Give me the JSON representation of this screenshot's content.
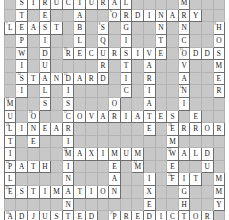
{
  "puzzle": {
    "title": "Statistics Crossword Grid",
    "columns": 19,
    "rows": 18,
    "colors": {
      "blocked": "#c8c8c8",
      "cell": "#ffffff",
      "letter": "#1a1a1a",
      "grid_line": "#6e6e6e"
    },
    "answers_across": [
      "STRUCTURAL",
      "ORDINARY",
      "LEAST",
      "RECURSIVE",
      "ODDS",
      "STANDARD",
      "COVARIATES",
      "LINEAR",
      "ERROR",
      "MAXIMUM",
      "WALD",
      "PATH",
      "FIT",
      "ESTIMATION",
      "ADJUSTED",
      "PREDICTOR"
    ],
    "rows_data": [
      [
        {
          "t": "b"
        },
        {
          "t": "c",
          "l": "S",
          "n": "1"
        },
        {
          "t": "c",
          "l": "T"
        },
        {
          "t": "c",
          "l": "R",
          "n": "2"
        },
        {
          "t": "c",
          "l": "U"
        },
        {
          "t": "c",
          "l": "C"
        },
        {
          "t": "c",
          "l": "T",
          "n": "3"
        },
        {
          "t": "c",
          "l": "U"
        },
        {
          "t": "c",
          "l": "R"
        },
        {
          "t": "c",
          "l": "A"
        },
        {
          "t": "c",
          "l": "L",
          "n": "4"
        },
        {
          "t": "b"
        },
        {
          "t": "b"
        },
        {
          "t": "b"
        },
        {
          "t": "b"
        },
        {
          "t": "c",
          "l": "M",
          "n": "5"
        },
        {
          "t": "b"
        },
        {
          "t": "b"
        },
        {
          "t": "b"
        }
      ],
      [
        {
          "t": "b"
        },
        {
          "t": "c",
          "l": "T"
        },
        {
          "t": "b"
        },
        {
          "t": "c",
          "l": "E"
        },
        {
          "t": "b"
        },
        {
          "t": "b"
        },
        {
          "t": "c",
          "l": "A"
        },
        {
          "t": "b"
        },
        {
          "t": "b"
        },
        {
          "t": "c",
          "l": "O",
          "n": "6"
        },
        {
          "t": "c",
          "l": "R"
        },
        {
          "t": "c",
          "l": "D"
        },
        {
          "t": "c",
          "l": "I"
        },
        {
          "t": "c",
          "l": "N"
        },
        {
          "t": "c",
          "l": "A"
        },
        {
          "t": "c",
          "l": "R"
        },
        {
          "t": "c",
          "l": "Y"
        },
        {
          "t": "b"
        },
        {
          "t": "b"
        }
      ],
      [
        {
          "t": "c",
          "l": "L",
          "n": "7"
        },
        {
          "t": "c",
          "l": "E"
        },
        {
          "t": "c",
          "l": "A"
        },
        {
          "t": "c",
          "l": "S"
        },
        {
          "t": "c",
          "l": "T"
        },
        {
          "t": "b"
        },
        {
          "t": "c",
          "l": "B"
        },
        {
          "t": "b"
        },
        {
          "t": "c",
          "l": "S",
          "n": "8"
        },
        {
          "t": "b"
        },
        {
          "t": "c",
          "l": "G"
        },
        {
          "t": "b"
        },
        {
          "t": "b"
        },
        {
          "t": "c",
          "l": "N"
        },
        {
          "t": "b"
        },
        {
          "t": "c",
          "l": "N"
        },
        {
          "t": "b"
        },
        {
          "t": "b"
        },
        {
          "t": "c",
          "l": "H",
          "n": "9"
        }
      ],
      [
        {
          "t": "b"
        },
        {
          "t": "c",
          "l": "P"
        },
        {
          "t": "b"
        },
        {
          "t": "c",
          "l": "I"
        },
        {
          "t": "b"
        },
        {
          "t": "b"
        },
        {
          "t": "c",
          "l": "L"
        },
        {
          "t": "b"
        },
        {
          "t": "c",
          "l": "Q"
        },
        {
          "t": "b"
        },
        {
          "t": "c",
          "l": "I"
        },
        {
          "t": "b"
        },
        {
          "t": "b"
        },
        {
          "t": "c",
          "l": "T"
        },
        {
          "t": "b"
        },
        {
          "t": "c",
          "l": "C"
        },
        {
          "t": "b"
        },
        {
          "t": "b"
        },
        {
          "t": "c",
          "l": "O"
        }
      ],
      [
        {
          "t": "b"
        },
        {
          "t": "c",
          "l": "W"
        },
        {
          "t": "b"
        },
        {
          "t": "c",
          "l": "D"
        },
        {
          "t": "b"
        },
        {
          "t": "c",
          "l": "R",
          "n": "10"
        },
        {
          "t": "c",
          "l": "E"
        },
        {
          "t": "c",
          "l": "C"
        },
        {
          "t": "c",
          "l": "U"
        },
        {
          "t": "c",
          "l": "R"
        },
        {
          "t": "c",
          "l": "S"
        },
        {
          "t": "c",
          "l": "I"
        },
        {
          "t": "c",
          "l": "V"
        },
        {
          "t": "c",
          "l": "E"
        },
        {
          "t": "b"
        },
        {
          "t": "c",
          "l": "O",
          "n": "11"
        },
        {
          "t": "c",
          "l": "D"
        },
        {
          "t": "c",
          "l": "D"
        },
        {
          "t": "c",
          "l": "S"
        }
      ],
      [
        {
          "t": "b"
        },
        {
          "t": "c",
          "l": "I"
        },
        {
          "t": "b"
        },
        {
          "t": "c",
          "l": "U"
        },
        {
          "t": "b"
        },
        {
          "t": "b"
        },
        {
          "t": "b"
        },
        {
          "t": "b"
        },
        {
          "t": "c",
          "l": "R"
        },
        {
          "t": "b"
        },
        {
          "t": "c",
          "l": "T"
        },
        {
          "t": "b"
        },
        {
          "t": "c",
          "l": "A"
        },
        {
          "t": "b"
        },
        {
          "t": "b"
        },
        {
          "t": "c",
          "l": "V"
        },
        {
          "t": "b"
        },
        {
          "t": "b"
        },
        {
          "t": "c",
          "l": "M"
        }
      ],
      [
        {
          "t": "b"
        },
        {
          "t": "c",
          "l": "S",
          "n": "12"
        },
        {
          "t": "c",
          "l": "T"
        },
        {
          "t": "c",
          "l": "A"
        },
        {
          "t": "c",
          "l": "N"
        },
        {
          "t": "c",
          "l": "D",
          "n": "13"
        },
        {
          "t": "c",
          "l": "A"
        },
        {
          "t": "c",
          "l": "R"
        },
        {
          "t": "c",
          "l": "D"
        },
        {
          "t": "b"
        },
        {
          "t": "c",
          "l": "I"
        },
        {
          "t": "b"
        },
        {
          "t": "c",
          "l": "R"
        },
        {
          "t": "b"
        },
        {
          "t": "b"
        },
        {
          "t": "c",
          "l": "A"
        },
        {
          "t": "b"
        },
        {
          "t": "b"
        },
        {
          "t": "c",
          "l": "E"
        }
      ],
      [
        {
          "t": "b"
        },
        {
          "t": "c",
          "l": "I"
        },
        {
          "t": "b"
        },
        {
          "t": "c",
          "l": "L"
        },
        {
          "t": "b"
        },
        {
          "t": "c",
          "l": "I"
        },
        {
          "t": "b"
        },
        {
          "t": "b"
        },
        {
          "t": "b"
        },
        {
          "t": "b"
        },
        {
          "t": "c",
          "l": "C"
        },
        {
          "t": "b"
        },
        {
          "t": "c",
          "l": "I"
        },
        {
          "t": "b"
        },
        {
          "t": "b"
        },
        {
          "t": "c",
          "l": "N",
          "n": "14"
        },
        {
          "t": "b"
        },
        {
          "t": "b"
        },
        {
          "t": "c",
          "l": "R"
        }
      ],
      [
        {
          "t": "c",
          "l": "M",
          "n": "15"
        },
        {
          "t": "b"
        },
        {
          "t": "b"
        },
        {
          "t": "c",
          "l": "S"
        },
        {
          "t": "b"
        },
        {
          "t": "c",
          "l": "S"
        },
        {
          "t": "b"
        },
        {
          "t": "b"
        },
        {
          "t": "b"
        },
        {
          "t": "c",
          "l": "O"
        },
        {
          "t": "b"
        },
        {
          "t": "b"
        },
        {
          "t": "c",
          "l": "A"
        },
        {
          "t": "b"
        },
        {
          "t": "b"
        },
        {
          "t": "c",
          "l": "I"
        },
        {
          "t": "b"
        },
        {
          "t": "b"
        },
        {
          "t": "b"
        }
      ],
      [
        {
          "t": "c",
          "l": "U"
        },
        {
          "t": "b"
        },
        {
          "t": "c",
          "l": "O",
          "n": "16"
        },
        {
          "t": "b"
        },
        {
          "t": "b"
        },
        {
          "t": "c",
          "l": "C",
          "n": "17"
        },
        {
          "t": "c",
          "l": "O"
        },
        {
          "t": "c",
          "l": "V"
        },
        {
          "t": "c",
          "l": "A"
        },
        {
          "t": "c",
          "l": "R"
        },
        {
          "t": "c",
          "l": "I"
        },
        {
          "t": "c",
          "l": "A"
        },
        {
          "t": "c",
          "l": "T"
        },
        {
          "t": "c",
          "l": "E"
        },
        {
          "t": "c",
          "l": "S"
        },
        {
          "t": "b"
        },
        {
          "t": "c",
          "l": "E"
        },
        {
          "t": "b"
        },
        {
          "t": "b"
        }
      ],
      [
        {
          "t": "c",
          "l": "L",
          "n": "18"
        },
        {
          "t": "c",
          "l": "I"
        },
        {
          "t": "c",
          "l": "N"
        },
        {
          "t": "c",
          "l": "E"
        },
        {
          "t": "c",
          "l": "A"
        },
        {
          "t": "c",
          "l": "R"
        },
        {
          "t": "b"
        },
        {
          "t": "b"
        },
        {
          "t": "b"
        },
        {
          "t": "b"
        },
        {
          "t": "b"
        },
        {
          "t": "b"
        },
        {
          "t": "c",
          "l": "E"
        },
        {
          "t": "b"
        },
        {
          "t": "c",
          "l": "E",
          "n": "19"
        },
        {
          "t": "c",
          "l": "R"
        },
        {
          "t": "c",
          "l": "R"
        },
        {
          "t": "c",
          "l": "O"
        },
        {
          "t": "c",
          "l": "R"
        }
      ],
      [
        {
          "t": "c",
          "l": "T"
        },
        {
          "t": "b"
        },
        {
          "t": "c",
          "l": "E"
        },
        {
          "t": "b"
        },
        {
          "t": "b"
        },
        {
          "t": "c",
          "l": "I"
        },
        {
          "t": "b"
        },
        {
          "t": "b"
        },
        {
          "t": "b"
        },
        {
          "t": "b"
        },
        {
          "t": "b"
        },
        {
          "t": "b"
        },
        {
          "t": "b"
        },
        {
          "t": "b"
        },
        {
          "t": "c",
          "l": "M"
        },
        {
          "t": "b"
        },
        {
          "t": "b"
        },
        {
          "t": "b"
        },
        {
          "t": "b"
        }
      ],
      [
        {
          "t": "c",
          "l": "I"
        },
        {
          "t": "b"
        },
        {
          "t": "b"
        },
        {
          "t": "b"
        },
        {
          "t": "b"
        },
        {
          "t": "c",
          "l": "M",
          "n": "20"
        },
        {
          "t": "c",
          "l": "A"
        },
        {
          "t": "c",
          "l": "X"
        },
        {
          "t": "c",
          "l": "I"
        },
        {
          "t": "c",
          "l": "M"
        },
        {
          "t": "c",
          "l": "U"
        },
        {
          "t": "c",
          "l": "M"
        },
        {
          "t": "b"
        },
        {
          "t": "b"
        },
        {
          "t": "c",
          "l": "W",
          "n": "21"
        },
        {
          "t": "c",
          "l": "A"
        },
        {
          "t": "c",
          "l": "L"
        },
        {
          "t": "c",
          "l": "D"
        },
        {
          "t": "b"
        }
      ],
      [
        {
          "t": "c",
          "l": "P",
          "n": "22"
        },
        {
          "t": "c",
          "l": "A"
        },
        {
          "t": "c",
          "l": "T"
        },
        {
          "t": "c",
          "l": "H"
        },
        {
          "t": "b"
        },
        {
          "t": "c",
          "l": "I"
        },
        {
          "t": "b"
        },
        {
          "t": "b"
        },
        {
          "t": "b"
        },
        {
          "t": "c",
          "l": "E"
        },
        {
          "t": "b"
        },
        {
          "t": "c",
          "l": "M",
          "n": "23"
        },
        {
          "t": "b"
        },
        {
          "t": "b"
        },
        {
          "t": "c",
          "l": "E"
        },
        {
          "t": "b"
        },
        {
          "t": "b"
        },
        {
          "t": "c",
          "l": "U"
        },
        {
          "t": "b"
        }
      ],
      [
        {
          "t": "c",
          "l": "L"
        },
        {
          "t": "b"
        },
        {
          "t": "b"
        },
        {
          "t": "b"
        },
        {
          "t": "b"
        },
        {
          "t": "c",
          "l": "N"
        },
        {
          "t": "b"
        },
        {
          "t": "b"
        },
        {
          "t": "b"
        },
        {
          "t": "c",
          "l": "A"
        },
        {
          "t": "b"
        },
        {
          "t": "b"
        },
        {
          "t": "c",
          "l": "I"
        },
        {
          "t": "b"
        },
        {
          "t": "c",
          "l": "F",
          "n": "24"
        },
        {
          "t": "c",
          "l": "I"
        },
        {
          "t": "c",
          "l": "T"
        },
        {
          "t": "b"
        },
        {
          "t": "c",
          "l": "M"
        }
      ],
      [
        {
          "t": "c",
          "l": "E",
          "n": "25"
        },
        {
          "t": "c",
          "l": "S"
        },
        {
          "t": "c",
          "l": "T"
        },
        {
          "t": "c",
          "l": "I"
        },
        {
          "t": "c",
          "l": "M"
        },
        {
          "t": "c",
          "l": "A"
        },
        {
          "t": "c",
          "l": "T"
        },
        {
          "t": "c",
          "l": "I"
        },
        {
          "t": "c",
          "l": "O"
        },
        {
          "t": "c",
          "l": "N"
        },
        {
          "t": "b"
        },
        {
          "t": "b"
        },
        {
          "t": "c",
          "l": "X"
        },
        {
          "t": "b"
        },
        {
          "t": "b"
        },
        {
          "t": "c",
          "l": "G"
        },
        {
          "t": "b"
        },
        {
          "t": "b"
        },
        {
          "t": "c",
          "l": "M"
        }
      ],
      [
        {
          "t": "b"
        },
        {
          "t": "b"
        },
        {
          "t": "b"
        },
        {
          "t": "b"
        },
        {
          "t": "b"
        },
        {
          "t": "c",
          "l": "N"
        },
        {
          "t": "b"
        },
        {
          "t": "b"
        },
        {
          "t": "b"
        },
        {
          "t": "b"
        },
        {
          "t": "b"
        },
        {
          "t": "b"
        },
        {
          "t": "c",
          "l": "E"
        },
        {
          "t": "b"
        },
        {
          "t": "b"
        },
        {
          "t": "c",
          "l": "H"
        },
        {
          "t": "b"
        },
        {
          "t": "b"
        },
        {
          "t": "c",
          "l": "Y"
        }
      ],
      [
        {
          "t": "c",
          "l": "A",
          "n": "26"
        },
        {
          "t": "c",
          "l": "D"
        },
        {
          "t": "c",
          "l": "J"
        },
        {
          "t": "c",
          "l": "U"
        },
        {
          "t": "c",
          "l": "S"
        },
        {
          "t": "c",
          "l": "T"
        },
        {
          "t": "c",
          "l": "E"
        },
        {
          "t": "c",
          "l": "D"
        },
        {
          "t": "b"
        },
        {
          "t": "c",
          "l": "P",
          "n": "27"
        },
        {
          "t": "c",
          "l": "R"
        },
        {
          "t": "c",
          "l": "E"
        },
        {
          "t": "c",
          "l": "D"
        },
        {
          "t": "c",
          "l": "I"
        },
        {
          "t": "c",
          "l": "C"
        },
        {
          "t": "c",
          "l": "T"
        },
        {
          "t": "c",
          "l": "O"
        },
        {
          "t": "c",
          "l": "R"
        },
        {
          "t": "b"
        }
      ]
    ]
  }
}
